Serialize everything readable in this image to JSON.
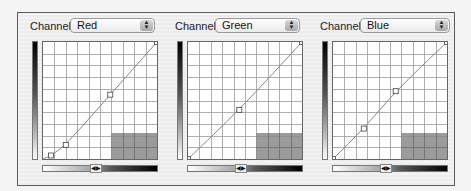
{
  "channel_label": "Channel:",
  "panels": [
    {
      "channel": "Red",
      "curve_points": [
        [
          0,
          0
        ],
        [
          0.07,
          0.03
        ],
        [
          0.2,
          0.12
        ],
        [
          0.59,
          0.55
        ],
        [
          1,
          1
        ]
      ],
      "handles": [
        [
          0.07,
          0.03
        ],
        [
          0.2,
          0.12
        ],
        [
          0.59,
          0.55
        ],
        [
          1,
          1
        ]
      ]
    },
    {
      "channel": "Green",
      "curve_points": [
        [
          0,
          0
        ],
        [
          0.45,
          0.42
        ],
        [
          1,
          1
        ]
      ],
      "handles": [
        [
          0,
          0
        ],
        [
          0.45,
          0.42
        ],
        [
          1,
          1
        ]
      ]
    },
    {
      "channel": "Blue",
      "curve_points": [
        [
          0,
          0
        ],
        [
          0.27,
          0.26
        ],
        [
          0.55,
          0.58
        ],
        [
          1,
          1
        ]
      ],
      "handles": [
        [
          0,
          0
        ],
        [
          0.27,
          0.26
        ],
        [
          0.55,
          0.58
        ],
        [
          1,
          1
        ]
      ]
    }
  ],
  "dropdown_arrow_glyph": "▲▼",
  "slider_knob_glyph": "◀▶",
  "colors": {
    "grid_line": "#9a9a9a",
    "shadow_box": "#8a8a8a",
    "curve": "#888888"
  }
}
